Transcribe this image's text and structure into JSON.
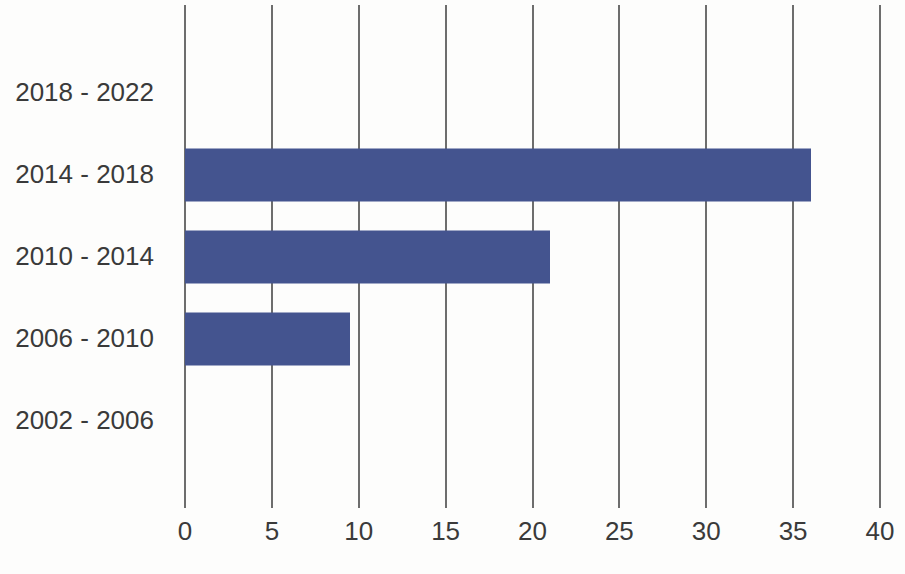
{
  "chart_data": {
    "type": "bar",
    "orientation": "horizontal",
    "title": "",
    "subtitle": "",
    "xlabel": "",
    "ylabel": "",
    "categories": [
      "2018 - 2022",
      "2014 - 2018",
      "2010 - 2014",
      "2006 - 2010",
      "2002 - 2006"
    ],
    "values": [
      0,
      36,
      21,
      9.5,
      0
    ],
    "series": [
      {
        "name": "",
        "values": [
          0,
          36,
          21,
          9.5,
          0
        ]
      }
    ],
    "xlim": [
      0,
      40
    ],
    "xticks": [
      0,
      5,
      10,
      15,
      20,
      25,
      30,
      35,
      40
    ],
    "xtick_labels": [
      "0",
      "5",
      "10",
      "15",
      "20",
      "25",
      "30",
      "35",
      "40"
    ],
    "grid": "vertical",
    "legend": "none",
    "annotations": [],
    "colors": {
      "bar": "#44548f",
      "gridline": "#6d6d6d",
      "text": "#3a3a3a",
      "background": "#fdfdfc"
    }
  }
}
